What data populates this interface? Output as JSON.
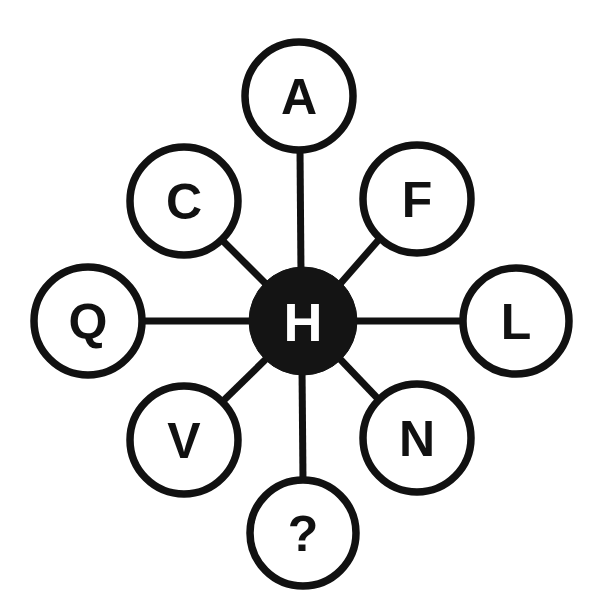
{
  "diagram": {
    "type": "hub-and-spoke-letter-puzzle",
    "canvas": {
      "width": 597,
      "height": 614,
      "background": "#ffffff"
    },
    "colors": {
      "ink": "#111111",
      "hub_fill": "#141414",
      "hub_text": "#ffffff",
      "node_fill": "#ffffff",
      "node_text": "#111111"
    },
    "hub": {
      "id": "hub",
      "label": "H",
      "cx": 303,
      "cy": 321,
      "r": 54,
      "style": "filled"
    },
    "nodes": [
      {
        "id": "node-a",
        "label": "A",
        "cx": 299,
        "cy": 96,
        "r": 54,
        "position": "top",
        "style": "outline"
      },
      {
        "id": "node-f",
        "label": "F",
        "cx": 417,
        "cy": 199,
        "r": 54,
        "position": "upper-right",
        "style": "outline"
      },
      {
        "id": "node-l",
        "label": "L",
        "cx": 516,
        "cy": 321,
        "r": 53,
        "position": "right",
        "style": "outline"
      },
      {
        "id": "node-n",
        "label": "N",
        "cx": 417,
        "cy": 438,
        "r": 54,
        "position": "lower-right",
        "style": "outline"
      },
      {
        "id": "node-question",
        "label": "?",
        "cx": 303,
        "cy": 533,
        "r": 53,
        "position": "bottom",
        "style": "outline"
      },
      {
        "id": "node-v",
        "label": "V",
        "cx": 184,
        "cy": 440,
        "r": 54,
        "position": "lower-left",
        "style": "outline"
      },
      {
        "id": "node-q",
        "label": "Q",
        "cx": 88,
        "cy": 321,
        "r": 54,
        "position": "left",
        "style": "outline"
      },
      {
        "id": "node-c",
        "label": "C",
        "cx": 184,
        "cy": 201,
        "r": 54,
        "position": "upper-left",
        "style": "outline"
      }
    ],
    "edges": [
      {
        "id": "edge-hub-a",
        "from": "hub",
        "to": "node-a",
        "x1": 301,
        "y1": 275,
        "x2": 300,
        "y2": 150
      },
      {
        "id": "edge-hub-f",
        "from": "hub",
        "to": "node-f",
        "x1": 340,
        "y1": 284,
        "x2": 382,
        "y2": 236
      },
      {
        "id": "edge-hub-l",
        "from": "hub",
        "to": "node-l",
        "x1": 349,
        "y1": 321,
        "x2": 463,
        "y2": 321
      },
      {
        "id": "edge-hub-n",
        "from": "hub",
        "to": "node-n",
        "x1": 340,
        "y1": 359,
        "x2": 382,
        "y2": 403
      },
      {
        "id": "edge-hub-question",
        "from": "hub",
        "to": "node-question",
        "x1": 302,
        "y1": 368,
        "x2": 303,
        "y2": 481
      },
      {
        "id": "edge-hub-v",
        "from": "hub",
        "to": "node-v",
        "x1": 266,
        "y1": 359,
        "x2": 220,
        "y2": 404
      },
      {
        "id": "edge-hub-q",
        "from": "hub",
        "to": "node-q",
        "x1": 256,
        "y1": 321,
        "x2": 142,
        "y2": 321
      },
      {
        "id": "edge-hub-c",
        "from": "hub",
        "to": "node-c",
        "x1": 266,
        "y1": 284,
        "x2": 221,
        "y2": 239
      }
    ]
  }
}
